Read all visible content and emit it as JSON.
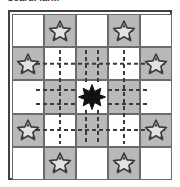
{
  "caption": {
    "text": "board: farm",
    "clipped": true
  },
  "board": {
    "name": "grid-board",
    "rows": 5,
    "columns": 5,
    "border_color": "#404040",
    "gridline_color": "#6b6b6b",
    "cell_colors": {
      "light": "#ffffff",
      "shaded": "#b9b9b9"
    },
    "pattern": "checkerboard",
    "cells": [
      [
        {
          "shade": "light",
          "token": "none"
        },
        {
          "shade": "shaded",
          "token": "light-star"
        },
        {
          "shade": "light",
          "token": "none"
        },
        {
          "shade": "shaded",
          "token": "light-star"
        },
        {
          "shade": "light",
          "token": "none"
        }
      ],
      [
        {
          "shade": "shaded",
          "token": "light-star"
        },
        {
          "shade": "light",
          "token": "none"
        },
        {
          "shade": "shaded",
          "token": "none"
        },
        {
          "shade": "light",
          "token": "none"
        },
        {
          "shade": "shaded",
          "token": "light-star"
        }
      ],
      [
        {
          "shade": "light",
          "token": "none"
        },
        {
          "shade": "shaded",
          "token": "none"
        },
        {
          "shade": "light",
          "token": "dark-star"
        },
        {
          "shade": "shaded",
          "token": "none"
        },
        {
          "shade": "light",
          "token": "none"
        }
      ],
      [
        {
          "shade": "shaded",
          "token": "light-star"
        },
        {
          "shade": "light",
          "token": "none"
        },
        {
          "shade": "shaded",
          "token": "none"
        },
        {
          "shade": "light",
          "token": "none"
        },
        {
          "shade": "shaded",
          "token": "light-star"
        }
      ],
      [
        {
          "shade": "light",
          "token": "none"
        },
        {
          "shade": "shaded",
          "token": "light-star"
        },
        {
          "shade": "light",
          "token": "none"
        },
        {
          "shade": "shaded",
          "token": "light-star"
        },
        {
          "shade": "light",
          "token": "none"
        }
      ]
    ]
  },
  "tokens": {
    "light_star": {
      "name": "light-star-piece",
      "fill": "#e3e3e3",
      "stroke": "#3a3a3a",
      "points": 5
    },
    "dark_star": {
      "name": "dark-star-piece",
      "fill": "#111111",
      "stroke": "#111111",
      "points": 6
    }
  },
  "connections": {
    "name": "dashed-move-network",
    "style": "dashed",
    "color": "#3a3a3a",
    "dash": "4 3",
    "width": 2,
    "description": "dashed lines radiating from the centre dark star through the middle three rows and columns"
  },
  "legend": {
    "center_cell": "r3c3",
    "center_token": "dark-star",
    "light_star_cells": [
      "r1c2",
      "r1c4",
      "r2c1",
      "r2c5",
      "r4c1",
      "r4c5",
      "r5c2",
      "r5c4"
    ]
  }
}
